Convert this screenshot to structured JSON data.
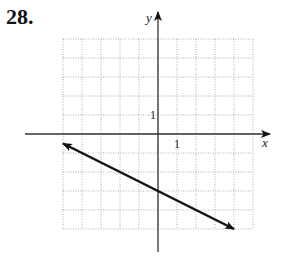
{
  "problem": {
    "number": "28."
  },
  "chart_data": {
    "type": "line",
    "title": "",
    "xlabel": "x",
    "ylabel": "y",
    "xlim": [
      -5,
      5
    ],
    "ylim": [
      -5,
      5
    ],
    "grid": true,
    "grid_style": "dotted",
    "tick_labels": {
      "x": [
        "1"
      ],
      "y": [
        "1"
      ]
    },
    "series": [
      {
        "name": "line",
        "equation": "y = -x/2 - 3",
        "slope": -0.5,
        "y_intercept": -3,
        "arrows": "both",
        "points": [
          [
            -5,
            -0.5
          ],
          [
            0,
            -3
          ],
          [
            4,
            -5
          ]
        ]
      }
    ]
  },
  "axes": {
    "x_label": "x",
    "y_label": "y",
    "x_tick": "1",
    "y_tick": "1"
  }
}
